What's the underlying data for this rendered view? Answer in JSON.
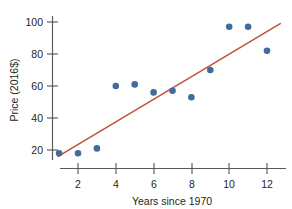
{
  "chart_data": {
    "type": "scatter",
    "title": "",
    "xlabel": "Years since 1970",
    "ylabel": "Price (2016$)",
    "xlim": [
      0.4,
      12.8
    ],
    "ylim": [
      12,
      104
    ],
    "grid": false,
    "legend": null,
    "x_ticks": [
      2,
      4,
      6,
      8,
      10,
      12
    ],
    "y_ticks": [
      20,
      40,
      60,
      80,
      100
    ],
    "x": [
      1,
      2,
      3,
      4,
      5,
      6,
      7,
      8,
      9,
      10,
      11,
      12
    ],
    "values": [
      18,
      18,
      21,
      60,
      61,
      56,
      57,
      53,
      70,
      97,
      97,
      82
    ],
    "points": [
      {
        "x": 1,
        "y": 18
      },
      {
        "x": 2,
        "y": 18
      },
      {
        "x": 3,
        "y": 21
      },
      {
        "x": 4,
        "y": 60
      },
      {
        "x": 5,
        "y": 61
      },
      {
        "x": 6,
        "y": 56
      },
      {
        "x": 7,
        "y": 57
      },
      {
        "x": 8,
        "y": 53
      },
      {
        "x": 9,
        "y": 70
      },
      {
        "x": 10,
        "y": 97
      },
      {
        "x": 11,
        "y": 97
      },
      {
        "x": 12,
        "y": 82
      }
    ],
    "series": [
      {
        "name": "Price observations",
        "type": "scatter",
        "values": [
          18,
          18,
          21,
          60,
          61,
          56,
          57,
          53,
          70,
          97,
          97,
          82
        ]
      },
      {
        "name": "Least-squares regression line",
        "type": "line",
        "x_endpoints": [
          0.95,
          12.7
        ],
        "y_endpoints": [
          16,
          99
        ]
      }
    ],
    "colors": {
      "point": "#3f6c9b",
      "line": "#c0533c",
      "axis": "#58595b",
      "text": "#231f20",
      "background": "#ffffff"
    }
  }
}
